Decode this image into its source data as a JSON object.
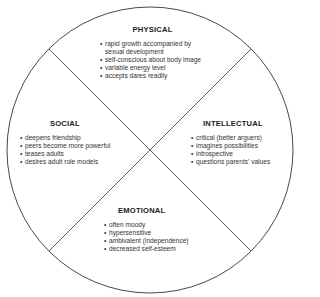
{
  "diagram": {
    "type": "circle divided into four quadrants by two diagonal lines",
    "colors": {
      "stroke": "#333333",
      "background": "#ffffff",
      "text": "#2a2a2a"
    },
    "quadrants": [
      {
        "id": "physical",
        "position": "top",
        "title": "PHYSICAL",
        "items": [
          "rapid growth accompanied by sexual development",
          "self-conscious about body image",
          "variable energy level",
          "accepts dares readily"
        ]
      },
      {
        "id": "social",
        "position": "left",
        "title": "SOCIAL",
        "items": [
          "deepens friendship",
          "peers become more powerful",
          "teases adults",
          "desires adult role models"
        ]
      },
      {
        "id": "intellectual",
        "position": "right",
        "title": "INTELLECTUAL",
        "items": [
          "critical (better arguers)",
          "imagines possibilities",
          "introspective",
          "questions parents' values"
        ]
      },
      {
        "id": "emotional",
        "position": "bottom",
        "title": "EMOTIONAL",
        "items": [
          "often moody",
          "hypersensitive",
          "ambivalent (independence)",
          "decreased self-esteem"
        ]
      }
    ]
  }
}
